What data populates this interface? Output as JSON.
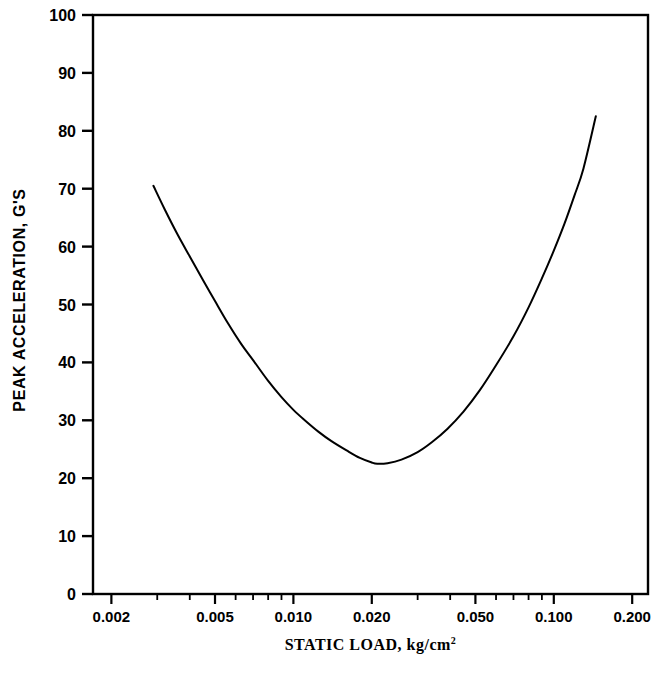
{
  "chart_data": {
    "type": "line",
    "title": "",
    "subtitle": "",
    "xlabel": "STATIC LOAD,  kg/cm",
    "xlabel_superscript": "2",
    "xlabel_full": "STATIC LOAD, kg/cm^2",
    "ylabel": "PEAK ACCELERATION, G'S",
    "xscale": "log",
    "yscale": "linear",
    "xlim": [
      0.0017,
      0.23
    ],
    "ylim": [
      0,
      100
    ],
    "grid": false,
    "legend": null,
    "legend_position": "none",
    "line_color": "#000000",
    "background_color": "#ffffff",
    "axis_color": "#000000",
    "xticks_major": [
      0.002,
      0.005,
      0.01,
      0.02,
      0.05,
      0.1,
      0.2
    ],
    "xticklabels": [
      "0.002",
      "0.005",
      "0.010",
      "0.020",
      "0.050",
      "0.100",
      "0.200"
    ],
    "xticks_minor": [
      0.002,
      0.003,
      0.004,
      0.005,
      0.006,
      0.007,
      0.008,
      0.009,
      0.01,
      0.02,
      0.03,
      0.04,
      0.05,
      0.06,
      0.07,
      0.08,
      0.09,
      0.1,
      0.2
    ],
    "yticks": [
      0,
      10,
      20,
      30,
      40,
      50,
      60,
      70,
      80,
      90,
      100
    ],
    "yticklabels": [
      "0",
      "10",
      "20",
      "30",
      "40",
      "50",
      "60",
      "70",
      "80",
      "90",
      "100"
    ],
    "series": [
      {
        "name": "peak acceleration vs static load",
        "x": [
          0.0029,
          0.0032,
          0.0036,
          0.004,
          0.0045,
          0.005,
          0.0056,
          0.0063,
          0.007,
          0.008,
          0.009,
          0.01,
          0.011,
          0.0125,
          0.014,
          0.016,
          0.018,
          0.02,
          0.021,
          0.023,
          0.026,
          0.03,
          0.034,
          0.039,
          0.045,
          0.052,
          0.06,
          0.07,
          0.08,
          0.09,
          0.1,
          0.11,
          0.12,
          0.13,
          0.145
        ],
        "y": [
          70.5,
          66.5,
          62.0,
          58.3,
          54.2,
          50.6,
          46.8,
          43.2,
          40.4,
          36.8,
          34.0,
          31.8,
          30.1,
          28.0,
          26.4,
          24.8,
          23.5,
          22.7,
          22.5,
          22.6,
          23.2,
          24.5,
          26.2,
          28.5,
          31.5,
          35.2,
          39.5,
          44.5,
          49.5,
          54.5,
          59.3,
          64.0,
          68.8,
          73.5,
          82.5
        ],
        "minimum": {
          "x": 0.021,
          "y": 22.5
        },
        "endpoints": {
          "left": {
            "x": 0.0029,
            "y": 70.5
          },
          "right": {
            "x": 0.145,
            "y": 82.5
          }
        }
      }
    ]
  }
}
